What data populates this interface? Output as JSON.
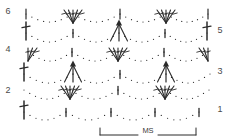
{
  "chart": {
    "background_color": "#ffffff",
    "ink_color": "#2b2b2b",
    "label_color": "#4a4a4a"
  },
  "row_labels": {
    "left": [
      {
        "text": "6",
        "x": 8,
        "y": 14
      },
      {
        "text": "4",
        "x": 8,
        "y": 52
      },
      {
        "text": "2",
        "x": 8,
        "y": 93
      }
    ],
    "right": [
      {
        "text": "5",
        "x": 220,
        "y": 33
      },
      {
        "text": "3",
        "x": 220,
        "y": 74
      },
      {
        "text": "1",
        "x": 220,
        "y": 112
      }
    ]
  },
  "repeat_bracket": {
    "label": "MS",
    "label_x": 148,
    "label_y": 133,
    "x_start": 100,
    "x_end": 196,
    "y": 128,
    "tick_height": 7
  },
  "legend_symbols": [
    {
      "name": "chain-stitch",
      "glyph": "dot",
      "meaning": "chain"
    },
    {
      "name": "double-crochet",
      "glyph": "vertical-bar-with-crossbar",
      "meaning": "double crochet"
    },
    {
      "name": "fan-shell",
      "glyph": "five-stitch-fan",
      "meaning": "shell of 5 double crochet"
    },
    {
      "name": "cluster-puff",
      "glyph": "filled-triangle-with-converging-legs",
      "meaning": "cluster / puff"
    },
    {
      "name": "single-bar",
      "glyph": "short-vertical-tick",
      "meaning": "single crochet"
    }
  ],
  "chart_data": {
    "type": "diagram",
    "xlabel": "",
    "ylabel": "",
    "grid": false,
    "legend_position": "none",
    "rows": [
      {
        "number": 1,
        "label_side": "right",
        "y": 112,
        "motifs": [
          {
            "type": "double-crochet",
            "x": 24
          },
          {
            "type": "chain-arc",
            "x_start": 24,
            "x_end": 66,
            "sag": 8,
            "dots": 7
          },
          {
            "type": "single-bar",
            "x": 66
          },
          {
            "type": "chain-arc",
            "x_start": 66,
            "x_end": 111,
            "sag": 8,
            "dots": 7
          },
          {
            "type": "single-bar",
            "x": 111
          },
          {
            "type": "chain-arc",
            "x_start": 111,
            "x_end": 155,
            "sag": 8,
            "dots": 7
          },
          {
            "type": "single-bar",
            "x": 155
          },
          {
            "type": "chain-arc",
            "x_start": 155,
            "x_end": 199,
            "sag": 8,
            "dots": 7
          },
          {
            "type": "single-bar",
            "x": 199
          }
        ]
      },
      {
        "number": 2,
        "label_side": "left",
        "y": 90,
        "motifs": [
          {
            "type": "fan-shell",
            "x": 70,
            "prongs": 5
          },
          {
            "type": "fan-shell",
            "x": 165,
            "prongs": 5
          },
          {
            "type": "chain-arc",
            "x_start": 24,
            "x_end": 70,
            "sag": 9,
            "dots": 8
          },
          {
            "type": "chain-arc",
            "x_start": 70,
            "x_end": 118,
            "sag": 9,
            "dots": 8
          },
          {
            "type": "chain-arc",
            "x_start": 118,
            "x_end": 165,
            "sag": 9,
            "dots": 8
          },
          {
            "type": "chain-arc",
            "x_start": 165,
            "x_end": 209,
            "sag": 9,
            "dots": 8
          },
          {
            "type": "single-bar",
            "x": 118
          }
        ]
      },
      {
        "number": 3,
        "label_side": "right",
        "y": 74,
        "motifs": [
          {
            "type": "double-crochet",
            "x": 24
          },
          {
            "type": "cluster-puff",
            "x": 73
          },
          {
            "type": "cluster-puff",
            "x": 166
          },
          {
            "type": "chain-arc",
            "x_start": 24,
            "x_end": 73,
            "sag": 9,
            "dots": 8
          },
          {
            "type": "chain-arc",
            "x_start": 73,
            "x_end": 120,
            "sag": 9,
            "dots": 8
          },
          {
            "type": "chain-arc",
            "x_start": 120,
            "x_end": 166,
            "sag": 9,
            "dots": 8
          },
          {
            "type": "chain-arc",
            "x_start": 166,
            "x_end": 210,
            "sag": 9,
            "dots": 8
          },
          {
            "type": "single-bar",
            "x": 120
          }
        ]
      },
      {
        "number": 4,
        "label_side": "left",
        "y": 52,
        "motifs": [
          {
            "type": "half-fan-left",
            "x": 28,
            "prongs": 3
          },
          {
            "type": "fan-shell",
            "x": 118,
            "prongs": 5
          },
          {
            "type": "half-fan-right",
            "x": 208,
            "prongs": 3
          },
          {
            "type": "chain-arc",
            "x_start": 28,
            "x_end": 72,
            "sag": 9,
            "dots": 8
          },
          {
            "type": "chain-arc",
            "x_start": 72,
            "x_end": 118,
            "sag": 9,
            "dots": 8
          },
          {
            "type": "chain-arc",
            "x_start": 118,
            "x_end": 164,
            "sag": 9,
            "dots": 8
          },
          {
            "type": "chain-arc",
            "x_start": 164,
            "x_end": 208,
            "sag": 9,
            "dots": 8
          },
          {
            "type": "single-bar",
            "x": 72
          },
          {
            "type": "single-bar",
            "x": 164
          }
        ]
      },
      {
        "number": 5,
        "label_side": "right",
        "y": 33,
        "motifs": [
          {
            "type": "double-crochet",
            "x": 26
          },
          {
            "type": "cluster-puff",
            "x": 119
          },
          {
            "type": "double-crochet",
            "x": 207
          },
          {
            "type": "chain-arc",
            "x_start": 26,
            "x_end": 73,
            "sag": 9,
            "dots": 8
          },
          {
            "type": "chain-arc",
            "x_start": 73,
            "x_end": 119,
            "sag": 9,
            "dots": 8
          },
          {
            "type": "chain-arc",
            "x_start": 119,
            "x_end": 165,
            "sag": 9,
            "dots": 8
          },
          {
            "type": "chain-arc",
            "x_start": 165,
            "x_end": 207,
            "sag": 9,
            "dots": 8
          },
          {
            "type": "single-bar",
            "x": 73
          },
          {
            "type": "single-bar",
            "x": 165
          }
        ]
      },
      {
        "number": 6,
        "label_side": "left",
        "y": 14,
        "motifs": [
          {
            "type": "fan-shell",
            "x": 73,
            "prongs": 5
          },
          {
            "type": "fan-shell",
            "x": 166,
            "prongs": 5
          },
          {
            "type": "chain-arc",
            "x_start": 26,
            "x_end": 73,
            "sag": 8,
            "dots": 8
          },
          {
            "type": "chain-arc",
            "x_start": 73,
            "x_end": 120,
            "sag": 8,
            "dots": 8
          },
          {
            "type": "chain-arc",
            "x_start": 120,
            "x_end": 166,
            "sag": 8,
            "dots": 8
          },
          {
            "type": "chain-arc",
            "x_start": 166,
            "x_end": 208,
            "sag": 8,
            "dots": 8
          },
          {
            "type": "edge-bar",
            "x": 26
          },
          {
            "type": "edge-bar",
            "x": 120
          },
          {
            "type": "edge-bar",
            "x": 208
          }
        ]
      }
    ]
  }
}
